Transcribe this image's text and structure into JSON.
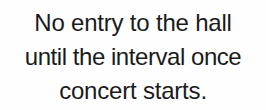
{
  "sign": {
    "background_color": "#fefefe",
    "text_color": "#1b1b1b",
    "lines": [
      {
        "text": "No entry to the hall"
      },
      {
        "text": "until the interval once"
      },
      {
        "text": "concert starts."
      }
    ],
    "full_text": "No entry to the hall until the interval once concert starts."
  }
}
